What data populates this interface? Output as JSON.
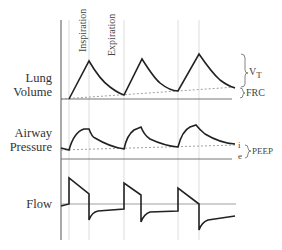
{
  "labels": {
    "lung_volume_line1": "Lung",
    "lung_volume_line2": "Volume",
    "airway_pressure_line1": "Airway",
    "airway_pressure_line2": "Pressure",
    "flow": "Flow",
    "inspiration": "Inspiration",
    "expiration": "Expiration",
    "vt": "V",
    "vt_sub": "T",
    "frc": "FRC",
    "peep": "PEEP",
    "i": "i",
    "e": "e"
  },
  "colors": {
    "trace": "#222222",
    "axis": "#555555",
    "grid": "#cccccc",
    "dashed": "#888888"
  }
}
